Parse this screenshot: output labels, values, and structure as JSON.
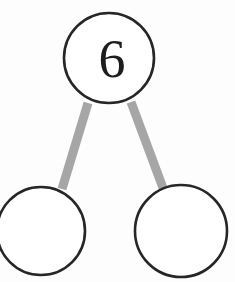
{
  "diagram": {
    "type": "number-bond",
    "background_color": "#fdfdfd",
    "node_stroke_color": "#262626",
    "node_fill_color": "#ffffff",
    "connector_color": "#a6a6a6",
    "text_color": "#1d1d1d",
    "whole": {
      "label": "6",
      "name": "whole-node",
      "cx": 109,
      "cy": 58,
      "r": 45
    },
    "parts": [
      {
        "label": "",
        "name": "part-left-node",
        "cx": 41,
        "cy": 231,
        "r": 44
      },
      {
        "label": "",
        "name": "part-right-node",
        "cx": 181,
        "cy": 231,
        "r": 46
      }
    ],
    "connectors": [
      {
        "name": "connector-left",
        "from": "whole-node",
        "to": "part-left-node",
        "x1": 88,
        "y1": 103,
        "x2": 62,
        "y2": 189
      },
      {
        "name": "connector-right",
        "from": "whole-node",
        "to": "part-right-node",
        "x1": 131,
        "y1": 102,
        "x2": 163,
        "y2": 188
      }
    ]
  }
}
